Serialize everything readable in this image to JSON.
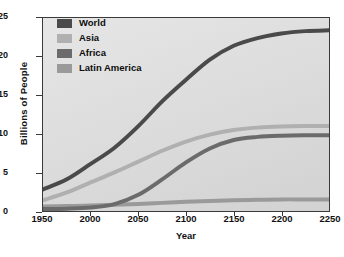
{
  "chart_data": {
    "type": "line",
    "title": "",
    "xlabel": "Year",
    "ylabel": "Billions of People",
    "xlim": [
      1950,
      2250
    ],
    "ylim": [
      0,
      25
    ],
    "xticks": [
      1950,
      2000,
      2050,
      2100,
      2150,
      2200,
      2250
    ],
    "yticks": [
      0,
      5,
      10,
      15,
      20,
      25
    ],
    "grid": false,
    "legend_position": "top-left",
    "x": [
      1950,
      1975,
      2000,
      2025,
      2050,
      2075,
      2100,
      2125,
      2150,
      2175,
      2200,
      2225,
      2250
    ],
    "series": [
      {
        "name": "World",
        "color": "#4a4a4a",
        "values": [
          2.8,
          4.1,
          6.1,
          8.2,
          11.0,
          14.2,
          17.0,
          19.6,
          21.4,
          22.4,
          23.0,
          23.3,
          23.4
        ]
      },
      {
        "name": "Asia",
        "color": "#b0b0b0",
        "values": [
          1.4,
          2.4,
          3.7,
          5.0,
          6.4,
          7.8,
          9.0,
          9.9,
          10.5,
          10.8,
          10.95,
          11.0,
          11.0
        ]
      },
      {
        "name": "Africa",
        "color": "#6b6b6b",
        "values": [
          0.25,
          0.3,
          0.45,
          0.9,
          2.1,
          4.1,
          6.3,
          8.1,
          9.2,
          9.6,
          9.75,
          9.8,
          9.8
        ]
      },
      {
        "name": "Latin America",
        "color": "#9a9a9a",
        "values": [
          0.6,
          0.65,
          0.7,
          0.8,
          0.9,
          1.05,
          1.2,
          1.3,
          1.4,
          1.45,
          1.5,
          1.5,
          1.5
        ]
      }
    ]
  },
  "legend": {
    "items": [
      {
        "label": "World",
        "color": "#4a4a4a"
      },
      {
        "label": "Asia",
        "color": "#b0b0b0"
      },
      {
        "label": "Africa",
        "color": "#6b6b6b"
      },
      {
        "label": "Latin America",
        "color": "#9a9a9a"
      }
    ]
  },
  "axes": {
    "y_title": "Billions of People",
    "x_title": "Year",
    "y_ticks": [
      "0",
      "5",
      "10",
      "15",
      "20",
      "25"
    ],
    "x_ticks": [
      "1950",
      "2000",
      "2050",
      "2100",
      "2150",
      "2200",
      "2250"
    ]
  }
}
